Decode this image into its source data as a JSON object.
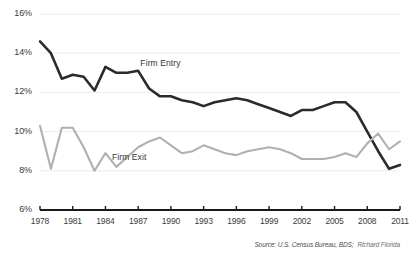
{
  "chart_data": {
    "type": "line",
    "title": "",
    "xlabel": "",
    "ylabel": "",
    "ylim": [
      6,
      16
    ],
    "xlim": [
      1978,
      2011
    ],
    "grid": true,
    "legend_position": "inline-annotations",
    "y_ticks": [
      "6%",
      "8%",
      "10%",
      "12%",
      "14%",
      "16%"
    ],
    "y_tick_values": [
      6,
      8,
      10,
      12,
      14,
      16
    ],
    "x_ticks": [
      "1978",
      "1981",
      "1984",
      "1987",
      "1990",
      "1993",
      "1996",
      "1999",
      "2002",
      "2005",
      "2008",
      "2011"
    ],
    "x_tick_values": [
      1978,
      1981,
      1984,
      1987,
      1990,
      1993,
      1996,
      1999,
      2002,
      2005,
      2008,
      2011
    ],
    "x": [
      1978,
      1979,
      1980,
      1981,
      1982,
      1983,
      1984,
      1985,
      1986,
      1987,
      1988,
      1989,
      1990,
      1991,
      1992,
      1993,
      1994,
      1995,
      1996,
      1997,
      1998,
      1999,
      2000,
      2001,
      2002,
      2003,
      2004,
      2005,
      2006,
      2007,
      2008,
      2009,
      2010,
      2011
    ],
    "series": [
      {
        "name": "Firm Entry",
        "color": "#2b2b2b",
        "values": [
          14.6,
          14.0,
          12.7,
          12.9,
          12.8,
          12.1,
          13.3,
          13.0,
          13.0,
          13.1,
          12.2,
          11.8,
          11.8,
          11.6,
          11.5,
          11.3,
          11.5,
          11.6,
          11.7,
          11.6,
          11.4,
          11.2,
          11.0,
          10.8,
          11.1,
          11.1,
          11.3,
          11.5,
          11.5,
          11.0,
          10.0,
          9.0,
          8.1,
          8.3
        ]
      },
      {
        "name": "Firm Exit",
        "color": "#b0b0b0",
        "values": [
          10.3,
          8.1,
          10.2,
          10.2,
          9.2,
          8.0,
          8.9,
          8.2,
          8.7,
          9.2,
          9.5,
          9.7,
          9.3,
          8.9,
          9.0,
          9.3,
          9.1,
          8.9,
          8.8,
          9.0,
          9.1,
          9.2,
          9.1,
          8.9,
          8.6,
          8.6,
          8.6,
          8.7,
          8.9,
          8.7,
          9.4,
          9.9,
          9.1,
          9.5
        ]
      }
    ],
    "annotations": [
      {
        "text": "Firm Entry",
        "x": 1987.2,
        "y": 13.45
      },
      {
        "text": "Firm Exit",
        "x": 1984.6,
        "y": 8.65
      }
    ]
  },
  "source": {
    "text": "Source: U.S. Census Bureau, BDS;",
    "credit": "Richard Florida"
  }
}
